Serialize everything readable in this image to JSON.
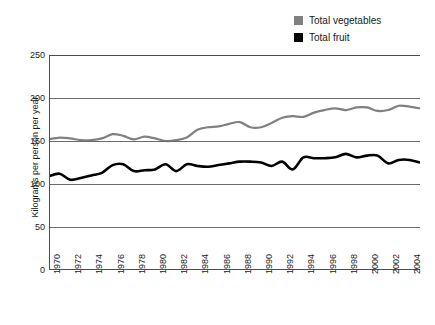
{
  "legend": {
    "position": "top-right",
    "entries": [
      {
        "label": "Total vegetables",
        "color": "#808080",
        "swatch": "square-swatch"
      },
      {
        "label": "Total fruit",
        "color": "#000000",
        "swatch": "square-swatch"
      }
    ]
  },
  "axes": {
    "ylabel": "Kilograms per person per year",
    "xlabel": "",
    "ylim": [
      0,
      250
    ],
    "yticks": [
      0,
      50,
      100,
      150,
      200,
      250
    ],
    "ytick_labels": [
      "0",
      "50",
      "100",
      "150",
      "200",
      "250"
    ],
    "xlim": [
      1970,
      2005
    ],
    "xtick_labels": [
      "1970",
      "1972",
      "1974",
      "1976",
      "1978",
      "1980",
      "1982",
      "1984",
      "1986",
      "1988",
      "1990",
      "1992",
      "1994",
      "1996",
      "1998",
      "2000",
      "2002",
      "2004"
    ],
    "grid": "horizontal"
  },
  "chart_data": {
    "type": "line",
    "title": "",
    "subtitle": "",
    "xlabel": "",
    "ylabel": "Kilograms per person per year",
    "xlim": [
      1970,
      2005
    ],
    "ylim": [
      0,
      250
    ],
    "grid": true,
    "legend_position": "top-right",
    "x": [
      1970,
      1971,
      1972,
      1973,
      1974,
      1975,
      1976,
      1977,
      1978,
      1979,
      1980,
      1981,
      1982,
      1983,
      1984,
      1985,
      1986,
      1987,
      1988,
      1989,
      1990,
      1991,
      1992,
      1993,
      1994,
      1995,
      1996,
      1997,
      1998,
      1999,
      2000,
      2001,
      2002,
      2003,
      2004,
      2005
    ],
    "series": [
      {
        "name": "Total vegetables",
        "color": "#808080",
        "values": [
          152,
          154,
          153,
          151,
          151,
          153,
          158,
          156,
          152,
          155,
          153,
          150,
          151,
          154,
          163,
          166,
          167,
          170,
          172,
          166,
          166,
          171,
          177,
          179,
          178,
          183,
          186,
          188,
          186,
          189,
          189,
          185,
          186,
          191,
          190,
          188
        ]
      },
      {
        "name": "Total fruit",
        "color": "#000000",
        "values": [
          109,
          112,
          105,
          107,
          110,
          113,
          122,
          123,
          115,
          116,
          117,
          123,
          115,
          123,
          121,
          120,
          122,
          124,
          126,
          126,
          125,
          121,
          126,
          117,
          131,
          130,
          130,
          131,
          135,
          131,
          133,
          133,
          124,
          128,
          128,
          125
        ]
      }
    ]
  }
}
